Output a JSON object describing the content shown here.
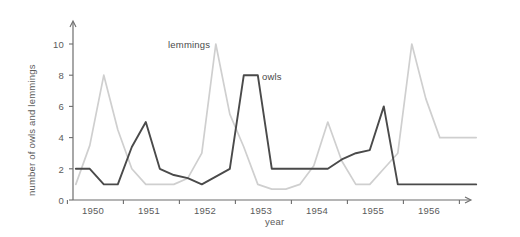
{
  "chart_data": {
    "type": "line",
    "title": "",
    "xlabel": "year",
    "ylabel": "number of owls and lemmings",
    "xlim": [
      1949.6,
      1956.9
    ],
    "ylim": [
      0,
      11
    ],
    "yticks": [
      0,
      2,
      4,
      6,
      8,
      10
    ],
    "xticks": [
      1950,
      1951,
      1952,
      1953,
      1954,
      1955,
      1956
    ],
    "xtick_labels": [
      "1950",
      "1951",
      "1952",
      "1953",
      "1954",
      "1955",
      "1956"
    ],
    "grid": false,
    "legend_position": "inline-annotations",
    "series": [
      {
        "name": "owls",
        "color": "#4a4a4a",
        "label_x": 1953.0,
        "label_y": 8.0,
        "x": [
          1949.65,
          1949.9,
          1950.15,
          1950.4,
          1950.65,
          1950.9,
          1951.15,
          1951.4,
          1951.65,
          1951.9,
          1952.15,
          1952.4,
          1952.65,
          1952.9,
          1953.15,
          1953.4,
          1953.65,
          1953.9,
          1954.15,
          1954.4,
          1954.65,
          1954.9,
          1955.15,
          1955.4,
          1955.65,
          1955.9,
          1956.15,
          1956.8
        ],
        "y": [
          2.0,
          2.0,
          1.0,
          1.0,
          3.4,
          5.0,
          2.0,
          1.6,
          1.4,
          1.0,
          1.5,
          2.0,
          8.0,
          8.0,
          2.0,
          2.0,
          2.0,
          2.0,
          2.0,
          2.6,
          3.0,
          3.2,
          6.0,
          1.0,
          1.0,
          1.0,
          1.0,
          1.0
        ]
      },
      {
        "name": "lemmings",
        "color": "#cfcfcf",
        "label_x": 1951.4,
        "label_y": 10.4,
        "x": [
          1949.65,
          1949.9,
          1950.15,
          1950.4,
          1950.65,
          1950.9,
          1951.15,
          1951.4,
          1951.65,
          1951.9,
          1952.15,
          1952.4,
          1952.65,
          1952.9,
          1953.15,
          1953.4,
          1953.65,
          1953.9,
          1954.15,
          1954.4,
          1954.65,
          1954.9,
          1955.15,
          1955.4,
          1955.65,
          1955.9,
          1956.15,
          1956.4,
          1956.8
        ],
        "y": [
          1.0,
          3.5,
          8.0,
          4.5,
          2.0,
          1.0,
          1.0,
          1.0,
          1.4,
          3.0,
          10.0,
          5.5,
          3.4,
          1.0,
          0.7,
          0.7,
          1.0,
          2.2,
          5.0,
          2.5,
          1.0,
          1.0,
          2.0,
          3.0,
          10.0,
          6.5,
          4.0,
          4.0,
          4.0
        ]
      }
    ],
    "annotations": [
      {
        "text": "lemmings",
        "x": 1951.4,
        "y": 10.4
      },
      {
        "text": "owls",
        "x": 1953.1,
        "y": 8.1
      }
    ],
    "axis_color": "#6d6d6d",
    "text_color": "#5b5b5b"
  }
}
